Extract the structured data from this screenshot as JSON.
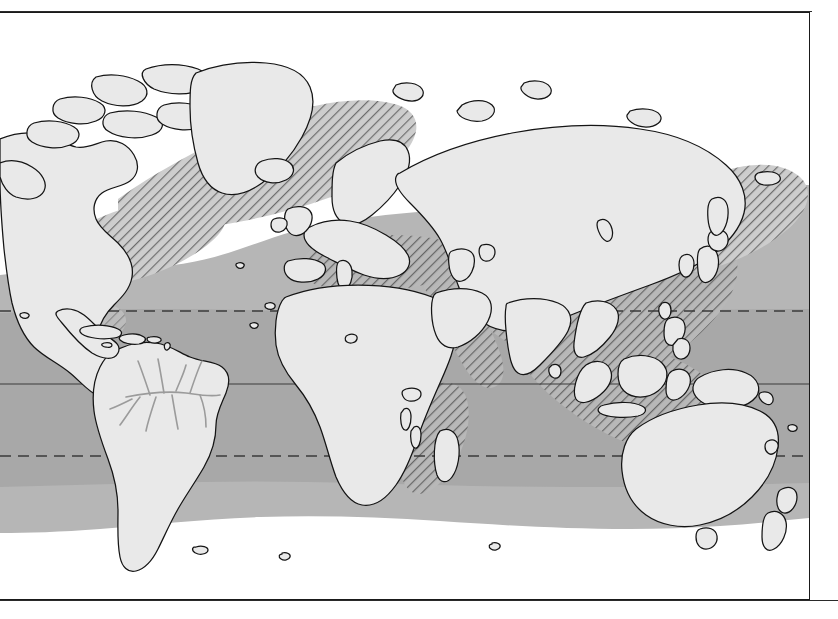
{
  "figure": {
    "type": "world-distribution-map",
    "projection": "equirectangular",
    "frame": {
      "x": 0,
      "y": 12,
      "width": 810,
      "height": 588
    },
    "background_color": "#ffffff",
    "land_color": "#e9e9e9",
    "land_outline_color": "#1a1a1a",
    "river_color": "#9a9a9a",
    "ocean_color": "#ffffff"
  },
  "legend_zones": [
    {
      "name": "temperate-range",
      "label": "Temperate / broad oceanic range",
      "fill": "#b4b4b4",
      "pattern": "solid",
      "description": "Solid mid-grey band covering most temperate and tropical oceans"
    },
    {
      "name": "core-tropical-range",
      "label": "Core tropical range",
      "fill": "#a6a6a6",
      "pattern": "solid-darker",
      "description": "Darker grey band between the tropics"
    },
    {
      "name": "hatched-range",
      "label": "Hatched extension range",
      "fill": "#c8c8c8",
      "pattern": "diagonal-hatch-45",
      "hatch_color": "#6f6f6f",
      "description": "Diagonal hatching over the North Atlantic, NW Pacific, Mediterranean, Red Sea, Indo-Pacific archipelago and SE African coast"
    }
  ],
  "latitude_lines": [
    {
      "name": "tropic-of-cancer",
      "style": "dashed",
      "y": 310,
      "color": "#3a3a3a"
    },
    {
      "name": "equator",
      "style": "solid",
      "y": 383,
      "color": "#3a3a3a"
    },
    {
      "name": "tropic-of-capricorn",
      "style": "dashed",
      "y": 455,
      "color": "#3a3a3a"
    }
  ],
  "rules": [
    {
      "name": "top-rule",
      "y": 11
    },
    {
      "name": "bottom-rule",
      "y": 600
    }
  ],
  "continents": [
    "North America",
    "Greenland",
    "South America",
    "Europe",
    "Africa",
    "Asia",
    "Australia",
    "New Zealand",
    "Indonesia",
    "Japan",
    "Madagascar",
    "Iceland",
    "British Isles",
    "Philippines",
    "New Guinea"
  ],
  "features": [
    {
      "name": "amazon-river-system",
      "type": "river-network",
      "color": "#9a9a9a"
    }
  ]
}
